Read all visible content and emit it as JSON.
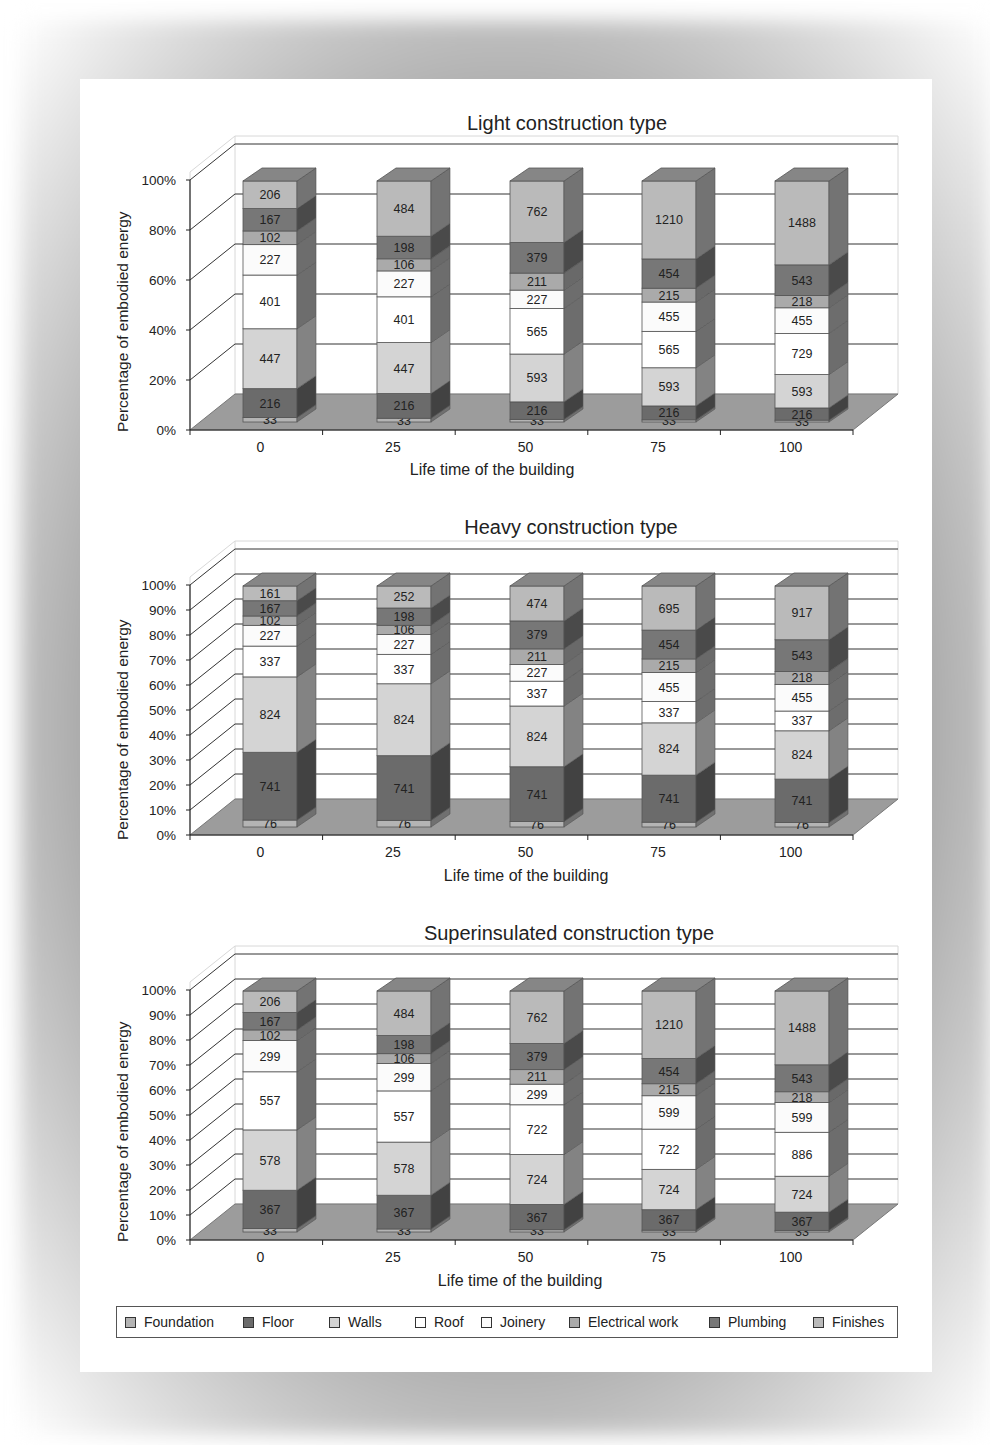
{
  "legend": {
    "items": [
      {
        "label": "Foundation",
        "color": "#b4b4b4"
      },
      {
        "label": "Floor",
        "color": "#6b6b6b"
      },
      {
        "label": "Walls",
        "color": "#d4d4d4"
      },
      {
        "label": "Roof",
        "color": "#ffffff"
      },
      {
        "label": "Joinery",
        "color": "#fbfbfb"
      },
      {
        "label": "Electrical work",
        "color": "#aaaaaa"
      },
      {
        "label": "Plumbing",
        "color": "#777777"
      },
      {
        "label": "Finishes",
        "color": "#bababa"
      }
    ]
  },
  "chart_data": [
    {
      "type": "bar",
      "stacked": true,
      "percent_stacked": true,
      "three_d": true,
      "title": "Light construction type",
      "xlabel": "Life time of the building",
      "ylabel": "Percentage of embodied energy",
      "categories": [
        "0",
        "25",
        "50",
        "75",
        "100"
      ],
      "yticks": [
        "0%",
        "20%",
        "40%",
        "60%",
        "80%",
        "100%"
      ],
      "ylim": [
        0,
        100
      ],
      "grid": true,
      "legend_position": "bottom",
      "series": [
        {
          "name": "Foundation",
          "values": [
            33,
            33,
            33,
            33,
            33
          ]
        },
        {
          "name": "Floor",
          "values": [
            216,
            216,
            216,
            216,
            216
          ]
        },
        {
          "name": "Walls",
          "values": [
            447,
            447,
            593,
            593,
            593
          ]
        },
        {
          "name": "Roof",
          "values": [
            401,
            401,
            565,
            565,
            729
          ]
        },
        {
          "name": "Joinery",
          "values": [
            227,
            227,
            227,
            455,
            455
          ]
        },
        {
          "name": "Electrical work",
          "values": [
            102,
            106,
            211,
            215,
            218
          ]
        },
        {
          "name": "Plumbing",
          "values": [
            167,
            198,
            379,
            454,
            543
          ]
        },
        {
          "name": "Finishes",
          "values": [
            206,
            484,
            762,
            1210,
            1488
          ]
        }
      ]
    },
    {
      "type": "bar",
      "stacked": true,
      "percent_stacked": true,
      "three_d": true,
      "title": "Heavy construction type",
      "xlabel": "Life time of the building",
      "ylabel": "Percentage of embodied energy",
      "categories": [
        "0",
        "25",
        "50",
        "75",
        "100"
      ],
      "yticks": [
        "0%",
        "10%",
        "20%",
        "30%",
        "40%",
        "50%",
        "60%",
        "70%",
        "80%",
        "90%",
        "100%"
      ],
      "ylim": [
        0,
        100
      ],
      "grid": true,
      "legend_position": "bottom",
      "series": [
        {
          "name": "Foundation",
          "values": [
            76,
            76,
            76,
            76,
            76
          ]
        },
        {
          "name": "Floor",
          "values": [
            741,
            741,
            741,
            741,
            741
          ]
        },
        {
          "name": "Walls",
          "values": [
            824,
            824,
            824,
            824,
            824
          ]
        },
        {
          "name": "Roof",
          "values": [
            337,
            337,
            337,
            337,
            337
          ]
        },
        {
          "name": "Joinery",
          "values": [
            227,
            227,
            227,
            455,
            455
          ]
        },
        {
          "name": "Electrical work",
          "values": [
            102,
            106,
            211,
            215,
            218
          ]
        },
        {
          "name": "Plumbing",
          "values": [
            167,
            198,
            379,
            454,
            543
          ]
        },
        {
          "name": "Finishes",
          "values": [
            161,
            252,
            474,
            695,
            917
          ]
        }
      ]
    },
    {
      "type": "bar",
      "stacked": true,
      "percent_stacked": true,
      "three_d": true,
      "title": "Superinsulated construction type",
      "xlabel": "Life time of the building",
      "ylabel": "Percentage of embodied energy",
      "categories": [
        "0",
        "25",
        "50",
        "75",
        "100"
      ],
      "yticks": [
        "0%",
        "10%",
        "20%",
        "30%",
        "40%",
        "50%",
        "60%",
        "70%",
        "80%",
        "90%",
        "100%"
      ],
      "ylim": [
        0,
        100
      ],
      "grid": true,
      "legend_position": "bottom",
      "series": [
        {
          "name": "Foundation",
          "values": [
            33,
            33,
            33,
            33,
            33
          ]
        },
        {
          "name": "Floor",
          "values": [
            367,
            367,
            367,
            367,
            367
          ]
        },
        {
          "name": "Walls",
          "values": [
            578,
            578,
            724,
            724,
            724
          ]
        },
        {
          "name": "Roof",
          "values": [
            557,
            557,
            722,
            722,
            886
          ]
        },
        {
          "name": "Joinery",
          "values": [
            299,
            299,
            299,
            599,
            599
          ]
        },
        {
          "name": "Electrical work",
          "values": [
            102,
            106,
            211,
            215,
            218
          ]
        },
        {
          "name": "Plumbing",
          "values": [
            167,
            198,
            379,
            454,
            543
          ]
        },
        {
          "name": "Finishes",
          "values": [
            206,
            484,
            762,
            1210,
            1488
          ]
        }
      ]
    }
  ]
}
